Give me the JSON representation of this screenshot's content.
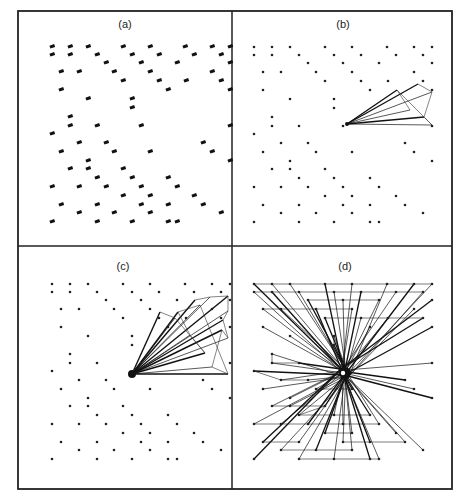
{
  "figure": {
    "frame": {
      "x": 18,
      "y": 11,
      "width": 434,
      "height": 478,
      "split_x": 232,
      "split_y": 246
    },
    "panels": [
      {
        "id": "a",
        "title": "(a)",
        "title_pos": [
          125,
          28
        ],
        "origin": [
          18,
          11
        ],
        "mode": "labels",
        "hub": null
      },
      {
        "id": "b",
        "title": "(b)",
        "title_pos": [
          343,
          28
        ],
        "origin": [
          232,
          11
        ],
        "mode": "fan",
        "hub": [
          347,
          124
        ],
        "fan_targets": [
          [
            418,
            84
          ],
          [
            432,
            92
          ],
          [
            424,
            117
          ],
          [
            432,
            125
          ],
          [
            397,
            90
          ],
          [
            410,
            110
          ]
        ]
      },
      {
        "id": "c",
        "title": "(c)",
        "title_pos": [
          123,
          270
        ],
        "origin": [
          18,
          246
        ],
        "mode": "fan",
        "hub": [
          132,
          374
        ],
        "fan_targets": [
          [
            195,
            300
          ],
          [
            210,
            297
          ],
          [
            228,
            296
          ],
          [
            228,
            311
          ],
          [
            223,
            320
          ],
          [
            228,
            338
          ],
          [
            222,
            330
          ],
          [
            212,
            367
          ],
          [
            228,
            374
          ],
          [
            200,
            305
          ],
          [
            178,
            312
          ],
          [
            190,
            335
          ],
          [
            205,
            353
          ],
          [
            175,
            318
          ],
          [
            160,
            312
          ]
        ]
      },
      {
        "id": "d",
        "title": "(d)",
        "title_pos": [
          345,
          270
        ],
        "origin": [
          232,
          246
        ],
        "mode": "star",
        "hub": [
          345,
          373
        ]
      }
    ],
    "points_rel": [
      [
        22,
        36
      ],
      [
        40,
        36
      ],
      [
        58,
        36
      ],
      [
        93,
        36
      ],
      [
        120,
        36
      ],
      [
        155,
        36
      ],
      [
        182,
        36
      ],
      [
        200,
        36
      ],
      [
        22,
        44
      ],
      [
        40,
        44
      ],
      [
        67,
        44
      ],
      [
        102,
        44
      ],
      [
        129,
        44
      ],
      [
        164,
        44
      ],
      [
        191,
        44
      ],
      [
        76,
        52
      ],
      [
        111,
        52
      ],
      [
        147,
        52
      ],
      [
        200,
        52
      ],
      [
        31,
        61
      ],
      [
        49,
        61
      ],
      [
        84,
        61
      ],
      [
        120,
        61
      ],
      [
        182,
        61
      ],
      [
        93,
        70
      ],
      [
        129,
        70
      ],
      [
        156,
        70
      ],
      [
        191,
        70
      ],
      [
        31,
        79
      ],
      [
        138,
        79
      ],
      [
        200,
        79
      ],
      [
        58,
        88
      ],
      [
        102,
        88
      ],
      [
        102,
        97
      ],
      [
        40,
        106
      ],
      [
        40,
        115
      ],
      [
        67,
        115
      ],
      [
        111,
        115
      ],
      [
        200,
        115
      ],
      [
        22,
        123
      ],
      [
        49,
        132
      ],
      [
        76,
        132
      ],
      [
        173,
        132
      ],
      [
        31,
        141
      ],
      [
        84,
        141
      ],
      [
        120,
        141
      ],
      [
        182,
        141
      ],
      [
        58,
        150
      ],
      [
        200,
        150
      ],
      [
        40,
        158
      ],
      [
        58,
        158
      ],
      [
        93,
        158
      ],
      [
        67,
        167
      ],
      [
        102,
        167
      ],
      [
        138,
        167
      ],
      [
        22,
        176
      ],
      [
        49,
        176
      ],
      [
        76,
        176
      ],
      [
        111,
        176
      ],
      [
        147,
        176
      ],
      [
        93,
        185
      ],
      [
        120,
        185
      ],
      [
        164,
        185
      ],
      [
        31,
        194
      ],
      [
        67,
        194
      ],
      [
        111,
        194
      ],
      [
        138,
        194
      ],
      [
        173,
        194
      ],
      [
        49,
        202
      ],
      [
        84,
        202
      ],
      [
        120,
        202
      ],
      [
        191,
        202
      ],
      [
        22,
        211
      ],
      [
        67,
        211
      ],
      [
        102,
        211
      ],
      [
        138,
        211
      ],
      [
        147,
        211
      ]
    ],
    "point_labels": "illegible small numeric labels beside each point in panel (a)"
  }
}
